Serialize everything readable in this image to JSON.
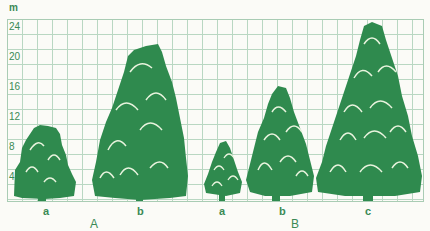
{
  "chart_data": {
    "type": "bar",
    "title": "",
    "ylabel": "m",
    "xlabel": "",
    "ylim": [
      0,
      25
    ],
    "yticks": [
      4,
      8,
      12,
      16,
      20,
      24
    ],
    "grid": true,
    "categories": [
      "A-a",
      "A-b",
      "B-a",
      "B-b",
      "B-c"
    ],
    "groups": [
      {
        "name": "A",
        "items": [
          {
            "label": "a",
            "height": 11
          },
          {
            "label": "b",
            "height": 21
          }
        ]
      },
      {
        "name": "B",
        "items": [
          {
            "label": "a",
            "height": 8
          },
          {
            "label": "b",
            "height": 16
          },
          {
            "label": "c",
            "height": 24.5
          }
        ]
      }
    ],
    "values": [
      11,
      21,
      8,
      16,
      24.5
    ],
    "marker": "tree silhouette"
  },
  "axis": {
    "unit": "m",
    "ticks": [
      "24",
      "20",
      "16",
      "12",
      "8",
      "4"
    ]
  },
  "labels": {
    "A_a": "a",
    "A_b": "b",
    "B_a": "a",
    "B_b": "b",
    "B_c": "c",
    "group_A": "A",
    "group_B": "B"
  },
  "colors": {
    "tree": "#2f8a4e",
    "grid": "#b9d7c2",
    "text": "#3a8a55",
    "highlight": "#e8f3dd"
  }
}
